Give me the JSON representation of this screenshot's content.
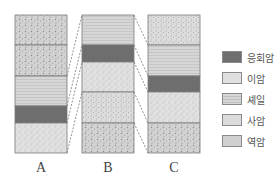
{
  "columns": [
    {
      "label": "A",
      "x": 15,
      "layers": [
        {
          "rock": "conglomerate",
          "top": 15,
          "bottom": 45
        },
        {
          "rock": "conglomerate",
          "top": 45,
          "bottom": 76
        },
        {
          "rock": "shale",
          "top": 76,
          "bottom": 106
        },
        {
          "rock": "tuff",
          "top": 106,
          "bottom": 123
        },
        {
          "rock": "mudstone",
          "top": 123,
          "bottom": 153
        }
      ]
    },
    {
      "label": "B",
      "x": 82,
      "layers": [
        {
          "rock": "shale",
          "top": 15,
          "bottom": 45
        },
        {
          "rock": "tuff",
          "top": 45,
          "bottom": 62
        },
        {
          "rock": "mudstone",
          "top": 62,
          "bottom": 92
        },
        {
          "rock": "sandstone",
          "top": 92,
          "bottom": 123
        },
        {
          "rock": "conglomerate",
          "top": 123,
          "bottom": 153
        }
      ]
    },
    {
      "label": "C",
      "x": 148,
      "layers": [
        {
          "rock": "sandstone",
          "top": 15,
          "bottom": 45
        },
        {
          "rock": "shale",
          "top": 45,
          "bottom": 76
        },
        {
          "rock": "tuff",
          "top": 76,
          "bottom": 92
        },
        {
          "rock": "mudstone",
          "top": 92,
          "bottom": 123
        },
        {
          "rock": "conglomerate",
          "top": 123,
          "bottom": 153
        }
      ]
    }
  ],
  "correlations": [
    {
      "from": "A",
      "to": "B",
      "pairs": [
        [
          76,
          15
        ],
        [
          106,
          45
        ],
        [
          123,
          62
        ],
        [
          153,
          92
        ]
      ]
    },
    {
      "from": "B",
      "to": "C",
      "pairs": [
        [
          15,
          45
        ],
        [
          45,
          76
        ],
        [
          62,
          92
        ],
        [
          92,
          123
        ],
        [
          123,
          153
        ]
      ]
    }
  ],
  "legend": [
    {
      "rock": "tuff",
      "label": "응회암"
    },
    {
      "rock": "mudstone",
      "label": "이암"
    },
    {
      "rock": "shale",
      "label": "셰일"
    },
    {
      "rock": "sandstone",
      "label": "사암"
    },
    {
      "rock": "conglomerate",
      "label": "역암"
    }
  ],
  "column_labels": {
    "a": "A",
    "b": "B",
    "c": "C"
  }
}
